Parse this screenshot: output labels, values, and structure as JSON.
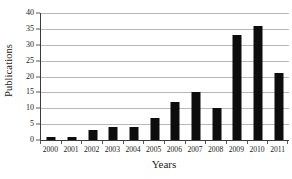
{
  "chart_data": {
    "type": "bar",
    "title": "",
    "xlabel": "Years",
    "ylabel": "Publications",
    "categories": [
      "2000",
      "2001",
      "2002",
      "2003",
      "2004",
      "2005",
      "2006",
      "2007",
      "2008",
      "2009",
      "2010",
      "2011"
    ],
    "values": [
      1,
      1,
      3,
      4,
      4,
      7,
      12,
      15,
      10,
      33,
      36,
      21
    ],
    "ylim": [
      0,
      40
    ],
    "yticks": [
      0,
      5,
      10,
      15,
      20,
      25,
      30,
      35,
      40
    ],
    "ytick_labels": [
      "0",
      "5",
      "10",
      "15",
      "20",
      "25",
      "30",
      "35",
      "40"
    ],
    "grid": true,
    "grid_axis": "y",
    "legend": false,
    "bar_color": "#0d0d0d",
    "grid_color": "#b9b9b9",
    "axis_color": "#3b3b3b",
    "background_color": "#ffffff"
  },
  "axes": {
    "x_title": "Years",
    "y_title": "Publications"
  }
}
